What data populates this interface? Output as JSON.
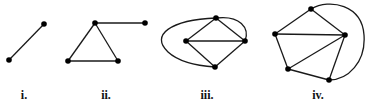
{
  "figure": {
    "background": "#ffffff",
    "stroke_color": "#1a1a1a",
    "node_color": "#000000",
    "graphs": [
      {
        "label": "i.",
        "label_x": 24,
        "nodes": [
          [
            9,
            60
          ],
          [
            44,
            24
          ]
        ],
        "edges": [
          [
            0,
            1
          ]
        ],
        "curves": []
      },
      {
        "label": "ii.",
        "label_x": 106,
        "nodes": [
          [
            95,
            23
          ],
          [
            145,
            23
          ],
          [
            68,
            61
          ],
          [
            118,
            61
          ]
        ],
        "edges": [
          [
            0,
            1
          ],
          [
            0,
            2
          ],
          [
            0,
            3
          ],
          [
            2,
            3
          ]
        ],
        "curves": []
      },
      {
        "label": "iii.",
        "label_x": 207,
        "nodes": [
          [
            216,
            18
          ],
          [
            186,
            41
          ],
          [
            245,
            41
          ],
          [
            215,
            67
          ]
        ],
        "edges": [
          [
            0,
            1
          ],
          [
            0,
            2
          ],
          [
            1,
            2
          ],
          [
            1,
            3
          ],
          [
            2,
            3
          ]
        ],
        "curves": [
          "M216,18 C170,20 150,35 168,52 C180,63 200,66 215,67",
          "M216,18 C240,15 250,28 245,41"
        ]
      },
      {
        "label": "iv.",
        "label_x": 318,
        "nodes": [
          [
            311,
            9
          ],
          [
            275,
            34
          ],
          [
            345,
            35
          ],
          [
            288,
            69
          ],
          [
            329,
            80
          ]
        ],
        "edges": [
          [
            0,
            1
          ],
          [
            0,
            2
          ],
          [
            1,
            2
          ],
          [
            1,
            3
          ],
          [
            2,
            3
          ],
          [
            2,
            4
          ],
          [
            3,
            4
          ]
        ],
        "curves": [
          "M311,9 C330,-2 362,5 364,35 C366,62 348,80 329,80"
        ]
      }
    ]
  }
}
